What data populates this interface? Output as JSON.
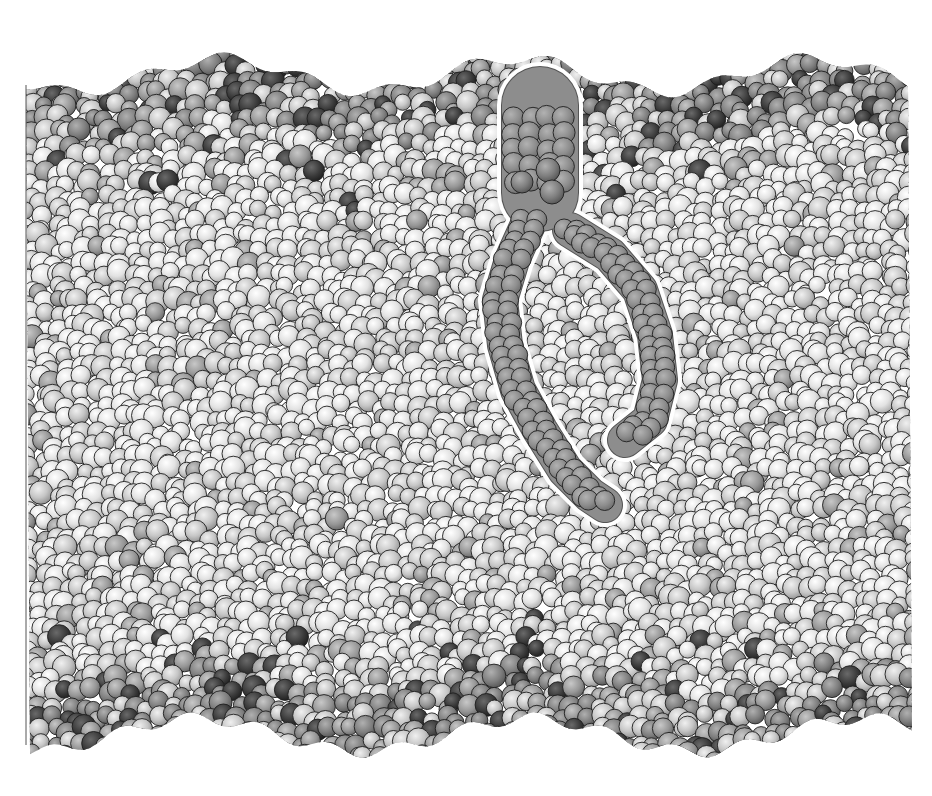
{
  "figure": {
    "subject": "Space-filling molecular model of a lipid bilayer membrane with one highlighted lipid molecule",
    "style": "grayscale space-filling (CPK) rendering",
    "caption_visible": false
  },
  "canvas": {
    "width": 932,
    "height": 796,
    "background": "#ffffff"
  },
  "membrane": {
    "left": 26,
    "right": 912,
    "top_edge_base": 75,
    "bottom_edge_base": 735,
    "edge_jitter": 28,
    "atom_radius_min": 8,
    "atom_radius_max": 12,
    "outline_color": "#1e1e1e",
    "colors": {
      "hydrogen_light": "#e6e6e6",
      "hydrogen_mid": "#cfcfcf",
      "carbon_gray": "#9c9c9c",
      "headgroup_gray": "#7e7e7e",
      "oxygen_dark": "#3a3a3a",
      "phosphate_dark": "#555555",
      "highlight_fill": "#8d8d8d",
      "highlight_outline": "#ffffff"
    },
    "leaflets": [
      {
        "name": "upper-leaflet",
        "headgroup_band": [
          70,
          190
        ]
      },
      {
        "name": "lower-leaflet",
        "headgroup_band": [
          600,
          740
        ]
      }
    ]
  },
  "highlighted_lipid": {
    "label": "highlighted lipid molecule",
    "head": {
      "cx": 540,
      "cy": 160,
      "rx": 38,
      "ry": 55
    },
    "tail_left": [
      [
        530,
        220
      ],
      [
        512,
        260
      ],
      [
        500,
        300
      ],
      [
        505,
        345
      ],
      [
        518,
        390
      ],
      [
        540,
        430
      ],
      [
        565,
        470
      ],
      [
        590,
        495
      ],
      [
        605,
        505
      ]
    ],
    "tail_right": [
      [
        570,
        230
      ],
      [
        610,
        255
      ],
      [
        640,
        290
      ],
      [
        655,
        335
      ],
      [
        660,
        380
      ],
      [
        650,
        420
      ],
      [
        625,
        440
      ]
    ],
    "tail_width": 34
  },
  "image_source_marks": {
    "left_border_line": true
  }
}
